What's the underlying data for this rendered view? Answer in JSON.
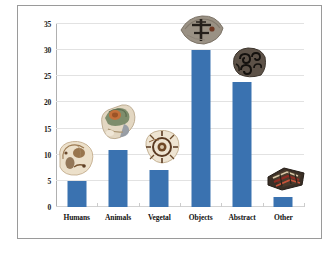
{
  "chart_data": {
    "type": "bar",
    "title": "",
    "subtitle": "",
    "xlabel": "",
    "ylabel": "",
    "categories": [
      "Humans",
      "Animals",
      "Vegetal",
      "Objects",
      "Abstract",
      "Other"
    ],
    "values": [
      5,
      11,
      7,
      30,
      24,
      2
    ],
    "series": [
      {
        "name": "Count",
        "values": [
          5,
          11,
          7,
          30,
          24,
          2
        ]
      }
    ],
    "ylim": [
      0,
      35
    ],
    "ytick_labels": [
      "0",
      "5",
      "10",
      "15",
      "20",
      "25",
      "30",
      "35"
    ],
    "ytick_values": [
      0,
      5,
      10,
      15,
      20,
      25,
      30,
      35
    ],
    "grid": true,
    "legend": false,
    "legend_position": "none",
    "bar_color": "#3a72b0",
    "gridline_color": "#e2e2e2",
    "axis_color": "#b0b0b0",
    "frame_color": "#9a9a9a",
    "background": "#ffffff",
    "annotations": [
      {
        "category": "Humans",
        "kind": "pottery-sherd-photo",
        "description": "cream and beige rounded ceramic sherd with brown figural motifs",
        "colors": [
          "#efe0cb",
          "#d8c3a4",
          "#6b4a2d"
        ]
      },
      {
        "category": "Animals",
        "kind": "pottery-sherd-photo",
        "description": "polychrome ceramic sherd with green, rust-orange and cream glaze",
        "colors": [
          "#7d8d6a",
          "#c4703a",
          "#e8dcc8",
          "#8a94a0"
        ]
      },
      {
        "category": "Vegetal",
        "kind": "pottery-sherd-photo",
        "description": "cream ceramic sherd with dark brown floral rosette motif",
        "colors": [
          "#efe5d4",
          "#5a3a22",
          "#8c6038"
        ]
      },
      {
        "category": "Objects",
        "kind": "pottery-sherd-photo",
        "description": "grey-brown ceramic sherd with dark cross motif",
        "colors": [
          "#9a9184",
          "#7a7065",
          "#2b2520"
        ]
      },
      {
        "category": "Abstract",
        "kind": "pottery-sherd-photo",
        "description": "dark ceramic sherd with black spiral and scroll motifs",
        "colors": [
          "#5d5248",
          "#2a241e",
          "#0f0d0b"
        ]
      },
      {
        "category": "Other",
        "kind": "pottery-sherd-photo",
        "description": "dark ceramic sherd fragments with red and maroon banding",
        "colors": [
          "#3a2f26",
          "#8e2b22",
          "#c9543a",
          "#d8c9a8"
        ]
      }
    ]
  }
}
